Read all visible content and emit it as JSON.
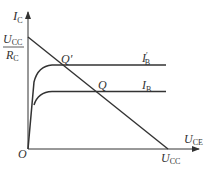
{
  "diagram": {
    "type": "transistor output characteristics with DC load line",
    "axes": {
      "y_label": "I",
      "y_sub": "C",
      "x_label": "U",
      "x_sub": "CE",
      "origin": "O"
    },
    "y_intercept": {
      "numerator": "U",
      "numerator_sub": "CC",
      "denominator": "R",
      "denominator_sub": "C"
    },
    "x_intercept": {
      "label": "U",
      "sub": "CC"
    },
    "curves": [
      {
        "label": "I",
        "sub": "B",
        "prime": "′",
        "name": "I'B"
      },
      {
        "label": "I",
        "sub": "B",
        "prime": "",
        "name": "IB"
      }
    ],
    "points": {
      "q_prime": "Q′",
      "q": "Q"
    },
    "colors": {
      "line": "#333333",
      "background": "#ffffff"
    }
  }
}
